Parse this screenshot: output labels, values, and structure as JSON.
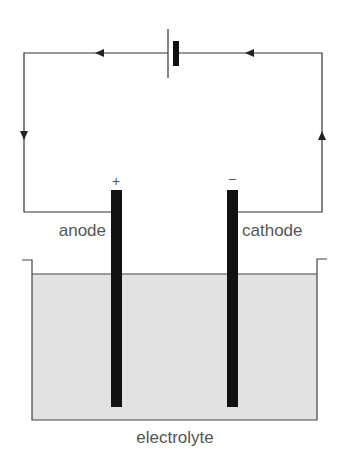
{
  "diagram": {
    "type": "electrolysis-cell",
    "labels": {
      "anode": "anode",
      "cathode": "cathode",
      "electrolyte": "electrolyte",
      "anode_sign": "+",
      "cathode_sign": "−"
    },
    "components": [
      "battery",
      "wire",
      "anode",
      "cathode",
      "beaker",
      "electrolyte"
    ],
    "current_direction": "anticlockwise (battery → left wire → anode; cathode → right wire → battery)",
    "colors": {
      "wire": "#333333",
      "electrode": "#111111",
      "electrolyte": "#e2e2e2",
      "text": "#555555"
    }
  }
}
